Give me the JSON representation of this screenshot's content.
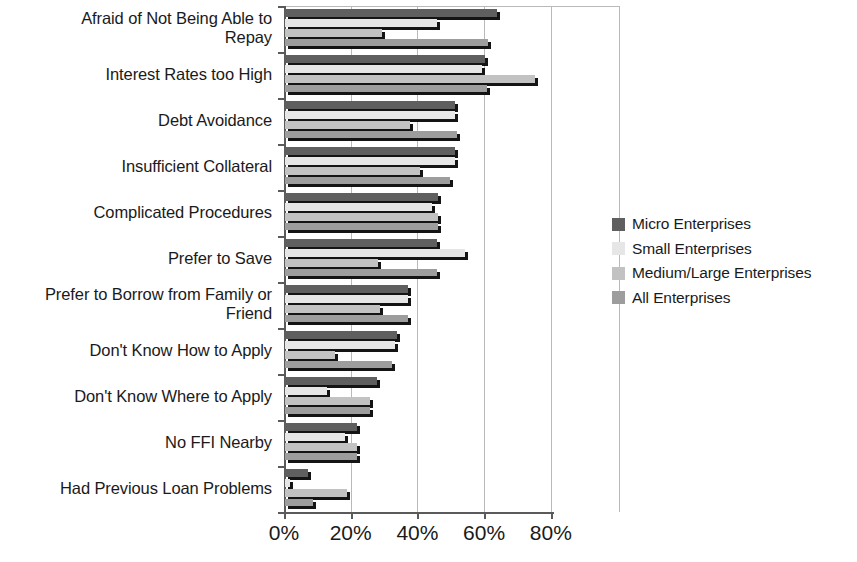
{
  "chart_data": {
    "type": "bar",
    "orientation": "horizontal",
    "title": "",
    "xlabel": "",
    "ylabel": "",
    "xlim": [
      0,
      85
    ],
    "xticks": [
      "0%",
      "20%",
      "40%",
      "60%",
      "80%"
    ],
    "xtick_values": [
      0,
      20,
      40,
      60,
      80
    ],
    "grid": true,
    "legend_position": "right",
    "categories": [
      "Afraid of Not Being Able to Repay",
      "Interest Rates too High",
      "Debt Avoidance",
      "Insufficient Collateral",
      "Complicated Procedures",
      "Prefer to Save",
      "Prefer to Borrow from Family or Friend",
      "Don't Know How to Apply",
      "Don't Know Where to Apply",
      "No FFI Nearby",
      "Had Previous Loan Problems"
    ],
    "category_lines": [
      [
        "Afraid of Not Being Able to",
        "Repay"
      ],
      [
        "Interest Rates too High"
      ],
      [
        "Debt Avoidance"
      ],
      [
        "Insufficient Collateral"
      ],
      [
        "Complicated Procedures"
      ],
      [
        "Prefer to Save"
      ],
      [
        "Prefer to Borrow from Family or",
        "Friend"
      ],
      [
        "Don't Know How to Apply"
      ],
      [
        "Don't Know Where to Apply"
      ],
      [
        "No FFI Nearby"
      ],
      [
        "Had Previous Loan Problems"
      ]
    ],
    "series": [
      {
        "name": "Micro Enterprises",
        "color": "#5f5f5f",
        "values": [
          63.5,
          60.0,
          51.0,
          51.0,
          46.0,
          45.5,
          37.0,
          33.5,
          27.5,
          21.5,
          7.0
        ]
      },
      {
        "name": "Small Enterprises",
        "color": "#e6e6e6",
        "values": [
          45.5,
          59.0,
          51.0,
          51.0,
          44.0,
          54.0,
          37.0,
          33.0,
          12.5,
          18.0,
          1.5
        ]
      },
      {
        "name": "Medium/Large Enterprises",
        "color": "#c2c2c2",
        "values": [
          29.0,
          75.0,
          37.5,
          40.5,
          46.0,
          28.0,
          28.5,
          15.0,
          25.5,
          21.5,
          18.5
        ]
      },
      {
        "name": "All Enterprises",
        "color": "#9d9d9d",
        "values": [
          61.0,
          60.5,
          51.5,
          49.5,
          46.0,
          45.5,
          37.0,
          32.0,
          25.5,
          21.5,
          8.5
        ]
      }
    ]
  },
  "legend": {
    "items": [
      {
        "label": "Micro Enterprises",
        "color": "#5f5f5f"
      },
      {
        "label": "Small Enterprises",
        "color": "#e6e6e6"
      },
      {
        "label": "Medium/Large Enterprises",
        "color": "#c2c2c2"
      },
      {
        "label": "All Enterprises",
        "color": "#9d9d9d"
      }
    ]
  },
  "axis": {
    "shadow_color": "#141414",
    "line_color": "#5a5a5a",
    "grid_color": "#b9b9b9"
  }
}
